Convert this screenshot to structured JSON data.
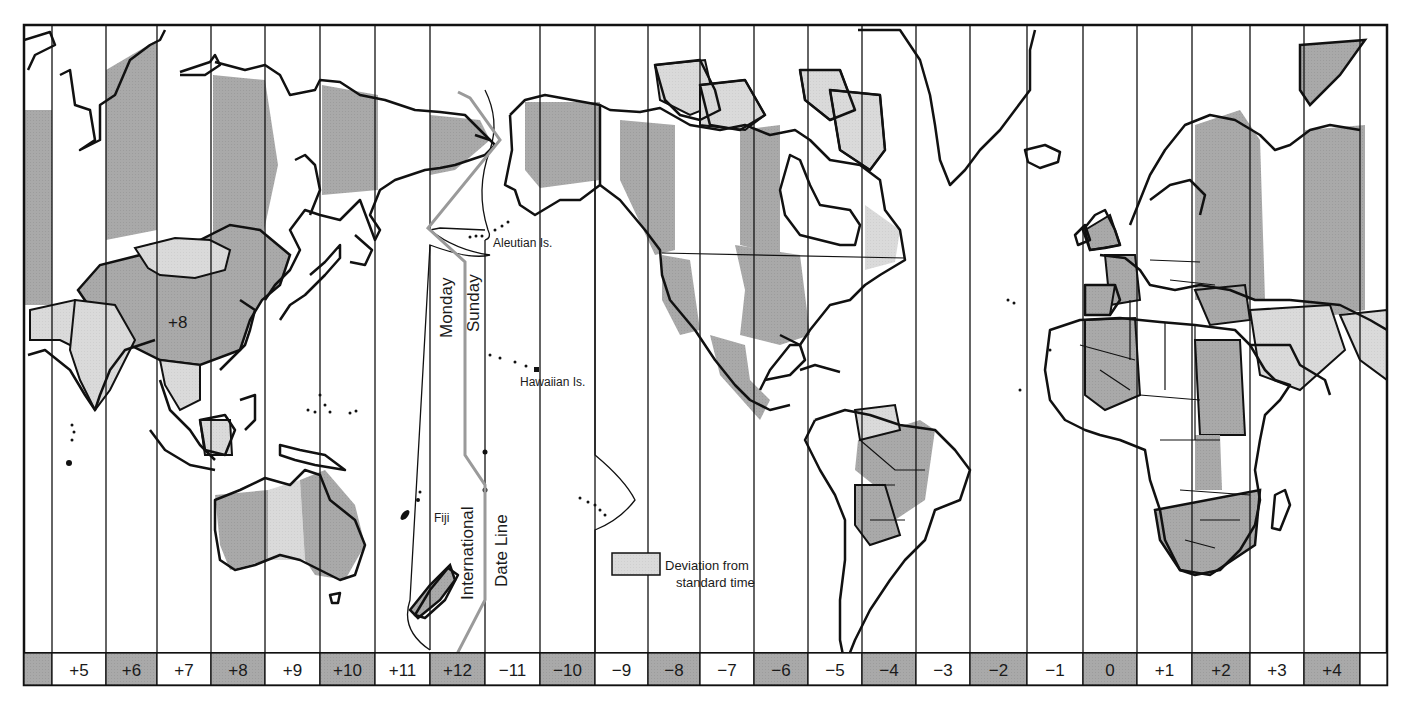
{
  "map": {
    "title": "World Time Zones",
    "colors": {
      "zone_dark": "#a7a7a7",
      "zone_light": "#ffffff",
      "deviation": "#d9d9d9",
      "outline": "#111111",
      "date_line": "#9a9a9a"
    },
    "zone_strip": [
      {
        "label": "",
        "shade": "dark"
      },
      {
        "label": "+5",
        "shade": "light"
      },
      {
        "label": "+6",
        "shade": "dark"
      },
      {
        "label": "+7",
        "shade": "light"
      },
      {
        "label": "+8",
        "shade": "dark"
      },
      {
        "label": "+9",
        "shade": "light"
      },
      {
        "label": "+10",
        "shade": "dark"
      },
      {
        "label": "+11",
        "shade": "light"
      },
      {
        "label": "+12",
        "shade": "dark"
      },
      {
        "label": "−11",
        "shade": "light"
      },
      {
        "label": "−10",
        "shade": "dark"
      },
      {
        "label": "−9",
        "shade": "light"
      },
      {
        "label": "−8",
        "shade": "dark"
      },
      {
        "label": "−7",
        "shade": "light"
      },
      {
        "label": "−6",
        "shade": "dark"
      },
      {
        "label": "−5",
        "shade": "light"
      },
      {
        "label": "−4",
        "shade": "dark"
      },
      {
        "label": "−3",
        "shade": "light"
      },
      {
        "label": "−2",
        "shade": "dark"
      },
      {
        "label": "−1",
        "shade": "light"
      },
      {
        "label": "0",
        "shade": "dark"
      },
      {
        "label": "+1",
        "shade": "light"
      },
      {
        "label": "+2",
        "shade": "dark"
      },
      {
        "label": "+3",
        "shade": "light"
      },
      {
        "label": "+4",
        "shade": "dark"
      },
      {
        "label": "",
        "shade": "light"
      }
    ],
    "labels": {
      "china_offset": "+8",
      "monday": "Monday",
      "sunday": "Sunday",
      "international": "International",
      "date_line": "Date Line",
      "aleutian": "Aleutian Is.",
      "hawaiian": "Hawaiian Is.",
      "fiji": "Fiji"
    },
    "legend": {
      "line1": "Deviation from",
      "line2": "standard time"
    }
  }
}
